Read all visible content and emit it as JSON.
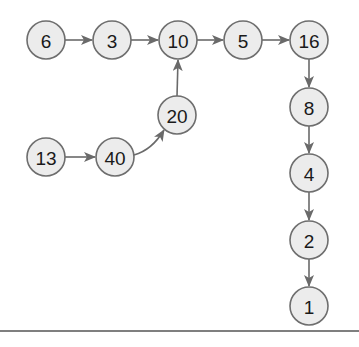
{
  "diagram": {
    "type": "directed-graph",
    "colors": {
      "node_fill": "#ececec",
      "node_stroke": "#6e6e6e",
      "edge": "#6a6a6a",
      "text": "#1a1a1a",
      "rule": "#555555"
    },
    "node_radius": 19,
    "nodes": [
      {
        "id": "n6",
        "label": "6",
        "x": 46,
        "y": 40
      },
      {
        "id": "n3",
        "label": "3",
        "x": 112,
        "y": 40
      },
      {
        "id": "n10",
        "label": "10",
        "x": 178,
        "y": 40
      },
      {
        "id": "n5",
        "label": "5",
        "x": 243,
        "y": 40
      },
      {
        "id": "n16",
        "label": "16",
        "x": 309,
        "y": 40
      },
      {
        "id": "n20",
        "label": "20",
        "x": 177,
        "y": 115
      },
      {
        "id": "n13",
        "label": "13",
        "x": 46,
        "y": 157
      },
      {
        "id": "n40",
        "label": "40",
        "x": 115,
        "y": 157
      },
      {
        "id": "n8",
        "label": "8",
        "x": 309,
        "y": 107
      },
      {
        "id": "n4",
        "label": "4",
        "x": 309,
        "y": 173
      },
      {
        "id": "n2",
        "label": "2",
        "x": 309,
        "y": 240
      },
      {
        "id": "n1",
        "label": "1",
        "x": 309,
        "y": 306
      }
    ],
    "edges": [
      {
        "from": "6",
        "to": "3"
      },
      {
        "from": "3",
        "to": "10"
      },
      {
        "from": "10",
        "to": "5"
      },
      {
        "from": "5",
        "to": "16"
      },
      {
        "from": "20",
        "to": "10"
      },
      {
        "from": "13",
        "to": "40"
      },
      {
        "from": "40",
        "to": "20",
        "curved": true
      },
      {
        "from": "16",
        "to": "8"
      },
      {
        "from": "8",
        "to": "4"
      },
      {
        "from": "4",
        "to": "2"
      },
      {
        "from": "2",
        "to": "1"
      }
    ]
  }
}
